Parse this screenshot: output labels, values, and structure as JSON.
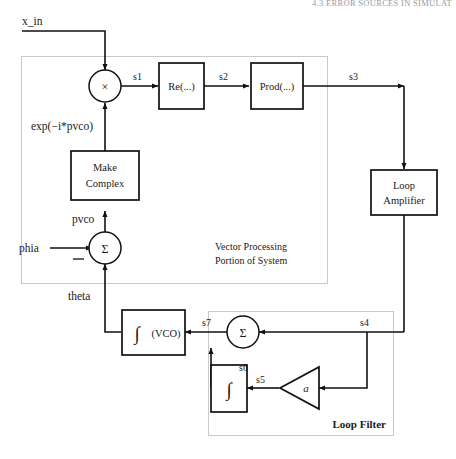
{
  "page": {
    "running_header": "4.3  ERROR SOURCES IN SIMULAT",
    "figure_type": "block-diagram",
    "background_color": "#ffffff",
    "line_color": "#111111",
    "group_border_color": "#c9c9c9"
  },
  "inputs": {
    "x_in": "x_in",
    "phia": "phia"
  },
  "signals": {
    "s1": "s1",
    "s2": "s2",
    "s3": "s3",
    "s4": "s4",
    "s5": "s5",
    "s6": "s6",
    "s7": "s7",
    "pvco": "pvco",
    "theta": "theta",
    "exp": "exp(−i*pvco)"
  },
  "blocks": {
    "multiplier": "×",
    "re": "Re(...)",
    "prod": "Prod(...)",
    "make_complex_line1": "Make",
    "make_complex_line2": "Complex",
    "summer_vector": "Σ",
    "summer_loop": "Σ",
    "loop_amp_line1": "Loop",
    "loop_amp_line2": "Amplifier",
    "vco_integrator": "∫",
    "vco_label": "(VCO)",
    "filter_integrator": "∫",
    "gain": "a",
    "minus_sign": "−"
  },
  "groups": {
    "vector_processing_line1": "Vector Processing",
    "vector_processing_line2": "Portion of System",
    "loop_filter": "Loop Filter"
  }
}
